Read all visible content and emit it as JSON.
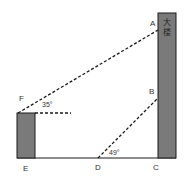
{
  "diagram": {
    "type": "geometry-figure",
    "building": {
      "label": "大楼",
      "chars": [
        "大",
        "楼"
      ],
      "fill": "#7a7a7a"
    },
    "small_building": {
      "fill": "#7a7a7a"
    },
    "points": {
      "A": "A",
      "B": "B",
      "C": "C",
      "D": "D",
      "E": "E",
      "F": "F"
    },
    "angles": {
      "F_elevation": "35°",
      "D_elevation": "49°"
    },
    "colors": {
      "line": "#1a1a1a",
      "fill": "#7a7a7a",
      "text": "#333333"
    }
  }
}
